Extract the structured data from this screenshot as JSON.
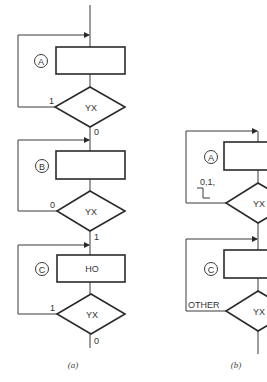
{
  "diagram_a": {
    "caption": "(a)",
    "blocks": [
      {
        "label": "A",
        "text": "",
        "decision": "YX",
        "loop_label": "1",
        "exit_label": "0"
      },
      {
        "label": "B",
        "text": "",
        "decision": "YX",
        "loop_label": "0",
        "exit_label": "1"
      },
      {
        "label": "C",
        "text": "HO",
        "decision": "YX",
        "loop_label": "1",
        "exit_label": "0"
      }
    ]
  },
  "diagram_b": {
    "caption": "(b)",
    "blocks": [
      {
        "label": "A",
        "text": "",
        "decision": "YX",
        "loop_label": "0,1,",
        "loop_symbol": "falling-edge-step"
      },
      {
        "label": "C",
        "text": "",
        "decision": "YX",
        "loop_label": "OTHER"
      }
    ]
  },
  "colors": {
    "line": "#2a2a2a",
    "background": "#ffffff",
    "text": "#333333"
  }
}
